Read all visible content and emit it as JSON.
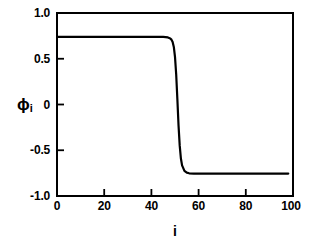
{
  "chart_data": {
    "type": "line",
    "title": "",
    "subtitle": "",
    "xlabel": "i",
    "ylabel": "ϕ",
    "ylabel_subscript": "i",
    "xlim": [
      0,
      100
    ],
    "ylim": [
      -1.0,
      1.0
    ],
    "grid": false,
    "legend": null,
    "xticks": [
      0,
      20,
      40,
      60,
      80,
      100
    ],
    "xtick_labels": [
      "0",
      "20",
      "40",
      "60",
      "80",
      "100"
    ],
    "yticks": [
      -1.0,
      -0.5,
      0,
      0.5,
      1.0
    ],
    "ytick_labels": [
      "-1.0",
      "-0.5",
      "0",
      "0.5",
      "1.0"
    ],
    "line_color": "#000000",
    "line_width": 2.2,
    "series": [
      {
        "name": "phi_i",
        "description": "kink / domain-wall profile: plateau at +0.74 for i<49, sharp tanh drop centred at i=50.5, plateau at -0.755 for i>53",
        "plateau_upper": 0.74,
        "plateau_lower": -0.755,
        "transition_center": 50.5,
        "transition_width": 1.15,
        "x": [
          0,
          2,
          4,
          6,
          8,
          10,
          12,
          14,
          16,
          18,
          20,
          22,
          24,
          26,
          28,
          30,
          32,
          34,
          36,
          38,
          40,
          42,
          44,
          45,
          46,
          47,
          48,
          48.5,
          49,
          49.5,
          50,
          50.5,
          51,
          51.5,
          52,
          52.5,
          53,
          54,
          55,
          56,
          58,
          60,
          62,
          64,
          66,
          68,
          70,
          72,
          74,
          76,
          78,
          80,
          82,
          84,
          86,
          88,
          90,
          92,
          94,
          96,
          98
        ],
        "y": [
          0.74,
          0.74,
          0.74,
          0.74,
          0.74,
          0.74,
          0.74,
          0.74,
          0.74,
          0.74,
          0.74,
          0.74,
          0.74,
          0.74,
          0.74,
          0.74,
          0.74,
          0.74,
          0.74,
          0.74,
          0.74,
          0.74,
          0.739,
          0.738,
          0.737,
          0.733,
          0.722,
          0.709,
          0.683,
          0.629,
          0.521,
          0.33,
          0.06,
          -0.23,
          -0.45,
          -0.59,
          -0.665,
          -0.725,
          -0.745,
          -0.752,
          -0.755,
          -0.755,
          -0.755,
          -0.755,
          -0.755,
          -0.755,
          -0.755,
          -0.755,
          -0.755,
          -0.755,
          -0.755,
          -0.755,
          -0.755,
          -0.755,
          -0.755,
          -0.755,
          -0.755,
          -0.755,
          -0.755,
          -0.755,
          -0.755
        ]
      }
    ]
  },
  "axes": {
    "y_tick_labels": [
      "1.0",
      "0.5",
      "0",
      "-0.5",
      "-1.0"
    ],
    "x_tick_labels": [
      "0",
      "20",
      "40",
      "60",
      "80",
      "100"
    ],
    "y_axis_title": "ϕ",
    "y_axis_subscript": "i",
    "x_axis_title": "i"
  }
}
